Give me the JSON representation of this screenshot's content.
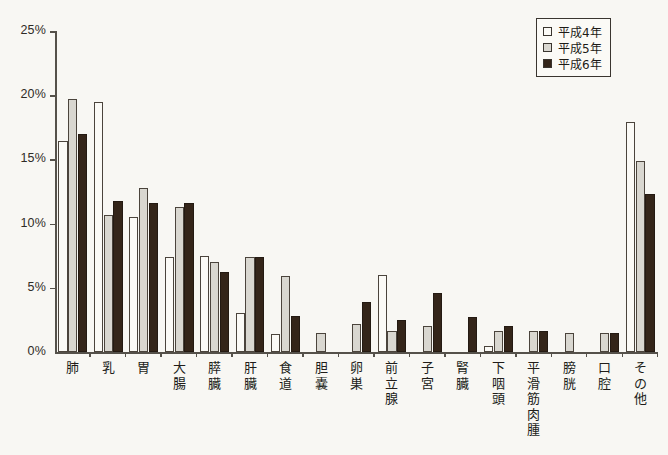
{
  "chart_data": {
    "type": "bar",
    "title": "",
    "subtitle": "",
    "xlabel": "",
    "ylabel": "",
    "ylim": [
      0,
      25
    ],
    "ytick_labels": [
      "0%",
      "5%",
      "10%",
      "15%",
      "20%",
      "25%"
    ],
    "ytick_values": [
      0,
      5,
      10,
      15,
      20,
      25
    ],
    "grid": false,
    "legend_position": "top-right",
    "value_unit": "%",
    "categories": [
      "肺",
      "乳",
      "胃",
      "大腸",
      "膵臓",
      "肝臓",
      "食道",
      "胆嚢",
      "卵巣",
      "前立腺",
      "子宮",
      "腎臓",
      "下咽頭",
      "平滑筋肉腫",
      "膀胱",
      "口腔",
      "その他"
    ],
    "series": [
      {
        "name": "平成4年",
        "color": "#fbfaf6",
        "values": [
          16.4,
          19.5,
          10.5,
          7.4,
          7.5,
          3.0,
          1.4,
          0.0,
          0.0,
          6.0,
          0.0,
          0.0,
          0.5,
          0.0,
          0.0,
          0.0,
          17.9
        ]
      },
      {
        "name": "平成5年",
        "color": "#d9d7d0",
        "values": [
          19.7,
          10.7,
          12.8,
          11.3,
          7.0,
          7.4,
          5.9,
          1.5,
          2.2,
          1.6,
          2.0,
          0.0,
          1.6,
          1.6,
          1.5,
          1.5,
          14.9
        ]
      },
      {
        "name": "平成6年",
        "color": "#342519",
        "values": [
          17.0,
          11.8,
          11.6,
          11.6,
          6.2,
          7.4,
          2.8,
          0.0,
          3.9,
          2.5,
          4.6,
          2.7,
          2.0,
          1.6,
          0.0,
          1.5,
          12.3
        ]
      }
    ]
  },
  "legend": {
    "items": [
      {
        "label": "平成4年",
        "swatch": "s0"
      },
      {
        "label": "平成5年",
        "swatch": "s1"
      },
      {
        "label": "平成6年",
        "swatch": "s2"
      }
    ]
  }
}
